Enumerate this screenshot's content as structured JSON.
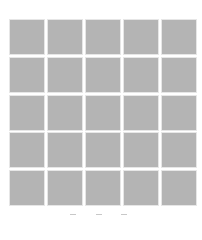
{
  "grid": {
    "rows": 5,
    "columns": 5,
    "tile_color": "#b4b4b4",
    "tile_border_color": "#e6e6e6",
    "tile_count": 25
  },
  "bottom_marks": {
    "count": 3,
    "color": "#c8c8c8",
    "note": "partially cut-off glyphs at bottom edge"
  }
}
